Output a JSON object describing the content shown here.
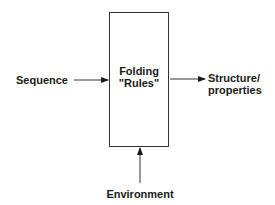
{
  "diagram": {
    "inputs": {
      "sequence": "Sequence",
      "environment": "Environment"
    },
    "process": {
      "line1": "Folding",
      "line2": "\"Rules\""
    },
    "output": {
      "line1": "Structure/",
      "line2": "properties"
    },
    "edges": [
      {
        "from": "Sequence",
        "to": "Folding \"Rules\"",
        "direction": "right"
      },
      {
        "from": "Folding \"Rules\"",
        "to": "Structure/properties",
        "direction": "right"
      },
      {
        "from": "Environment",
        "to": "Folding \"Rules\"",
        "direction": "up"
      }
    ]
  }
}
